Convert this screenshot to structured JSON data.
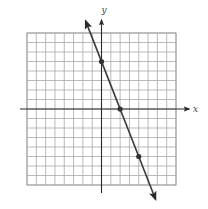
{
  "chart_data": {
    "type": "line",
    "title": "",
    "xlabel": "x",
    "ylabel": "y",
    "xlim": [
      -8,
      8
    ],
    "ylim": [
      -8,
      8
    ],
    "grid": true,
    "grid_step": 1,
    "tick_labels": false,
    "legend": null,
    "series": [
      {
        "name": "line",
        "equation": "y = -2.5x + 5",
        "slope": -2.5,
        "intercept": 5,
        "marked_points": [
          {
            "x": 0,
            "y": 5
          },
          {
            "x": 2,
            "y": 0
          },
          {
            "x": 4,
            "y": -5
          }
        ],
        "arrows_both_ends": true
      }
    ]
  },
  "labels": {
    "x_axis": "x",
    "y_axis": "y"
  },
  "colors": {
    "grid": "#a8a8a8",
    "axis": "#2a2a2a",
    "line": "#3a3a3a",
    "point": "#333333"
  }
}
